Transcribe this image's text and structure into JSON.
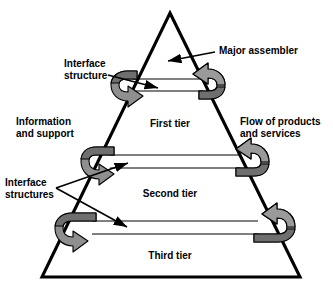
{
  "figure": {
    "kind": "pyramid-tier-diagram",
    "background_color": "#ffffff"
  },
  "colors": {
    "outline": "#000000",
    "arrow_light": "#9a9a9a",
    "arrow_mid": "#8a8a8a",
    "arrow_dark": "#6f6f6f",
    "flow_line": "#000000",
    "text": "#000000"
  },
  "pyramid": {
    "apex_label_area": "",
    "tiers": [
      {
        "id": "tier-1",
        "label": "First tier"
      },
      {
        "id": "tier-2",
        "label": "Second tier"
      },
      {
        "id": "tier-3",
        "label": "Third tier"
      }
    ]
  },
  "annotations": {
    "major_assembler": {
      "label": "Major assembler",
      "lines": [
        "Major assembler"
      ]
    },
    "interface_structure": {
      "label": "Interface structure",
      "lines": [
        "Interface",
        "structure"
      ]
    },
    "interface_structures": {
      "label": "Interface structures",
      "lines": [
        "Interface",
        "structures"
      ]
    },
    "information_and_support": {
      "label": "Information and support",
      "lines": [
        "Information",
        "and support"
      ]
    },
    "flow_of_products_and_services": {
      "label": "Flow of products and services",
      "lines": [
        "Flow of products",
        "and services"
      ]
    }
  },
  "loops": [
    {
      "id": "loop-tier-1",
      "tier": "First tier",
      "direction": "circular"
    },
    {
      "id": "loop-tier-2",
      "tier": "Second tier",
      "direction": "circular"
    },
    {
      "id": "loop-tier-3",
      "tier": "Third tier",
      "direction": "circular"
    }
  ]
}
